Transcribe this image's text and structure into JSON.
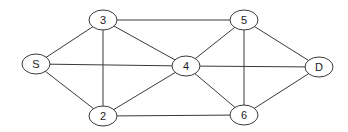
{
  "diagram": {
    "type": "undirected-graph",
    "nodes": [
      {
        "id": "S",
        "label": "S",
        "x": 36,
        "y": 64
      },
      {
        "id": "3",
        "label": "3",
        "x": 103,
        "y": 20
      },
      {
        "id": "2",
        "label": "2",
        "x": 103,
        "y": 116
      },
      {
        "id": "4",
        "label": "4",
        "x": 186,
        "y": 66
      },
      {
        "id": "5",
        "label": "5",
        "x": 244,
        "y": 20
      },
      {
        "id": "6",
        "label": "6",
        "x": 244,
        "y": 115
      },
      {
        "id": "D",
        "label": "D",
        "x": 319,
        "y": 67
      }
    ],
    "edges": [
      [
        "S",
        "3"
      ],
      [
        "S",
        "4"
      ],
      [
        "S",
        "2"
      ],
      [
        "3",
        "2"
      ],
      [
        "3",
        "4"
      ],
      [
        "3",
        "5"
      ],
      [
        "2",
        "4"
      ],
      [
        "2",
        "6"
      ],
      [
        "4",
        "5"
      ],
      [
        "4",
        "6"
      ],
      [
        "4",
        "D"
      ],
      [
        "5",
        "6"
      ],
      [
        "5",
        "D"
      ],
      [
        "6",
        "D"
      ]
    ],
    "colors": {
      "stroke": "#3a3a3a",
      "fill": "#ffffff",
      "text": "#222222"
    }
  }
}
